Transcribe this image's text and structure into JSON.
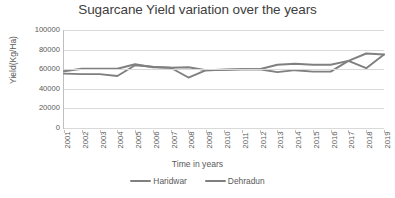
{
  "chart_data": {
    "type": "line",
    "title": "Sugarcane Yield variation over the years",
    "xlabel": "Time in years",
    "ylabel": "Yield(Kg/Ha)",
    "categories": [
      "2001",
      "2002",
      "2003",
      "2004",
      "2005",
      "2006",
      "2007",
      "2008",
      "2009",
      "2010",
      "2011",
      "2012",
      "2013",
      "2014",
      "2015",
      "2016",
      "2017",
      "2018",
      "2019"
    ],
    "ylim": [
      0,
      100000
    ],
    "y_ticks": [
      "100000",
      "80000",
      "60000",
      "40000",
      "20000",
      "0"
    ],
    "y_tick_values": [
      100000,
      80000,
      60000,
      40000,
      20000,
      0
    ],
    "grid": true,
    "legend_position": "bottom",
    "series": [
      {
        "name": "Haridwar",
        "color": "#808080",
        "values": [
          58000,
          60500,
          60500,
          60500,
          65000,
          62000,
          61500,
          62000,
          59000,
          59500,
          60000,
          60000,
          64500,
          65500,
          64500,
          64500,
          68500,
          76000,
          75000
        ]
      },
      {
        "name": "Dehradun",
        "color": "#7f7f7f",
        "values": [
          55500,
          55000,
          55000,
          53000,
          64000,
          62500,
          61500,
          51500,
          59000,
          59500,
          60000,
          60000,
          57000,
          59000,
          57500,
          57500,
          68500,
          61000,
          75000
        ]
      }
    ]
  },
  "legend": {
    "items": [
      {
        "label": "Haridwar"
      },
      {
        "label": "Dehradun"
      }
    ]
  }
}
